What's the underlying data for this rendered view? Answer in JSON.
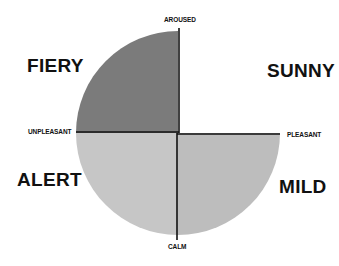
{
  "diagram": {
    "type": "mood-quadrant",
    "center": {
      "x": 178,
      "y": 133
    },
    "radius": 102,
    "axes": {
      "top": "AROUSED",
      "bottom": "CALM",
      "left": "UNPLEASANT",
      "right": "PLEASANT"
    },
    "quadrants": [
      {
        "id": "top-left",
        "label": "FIERY",
        "fill": "#7b7b7b"
      },
      {
        "id": "top-right",
        "label": "SUNNY",
        "fill": "#ffffff"
      },
      {
        "id": "bottom-left",
        "label": "ALERT",
        "fill": "#c6c6c6"
      },
      {
        "id": "bottom-right",
        "label": "MILD",
        "fill": "#bdbdbd"
      }
    ],
    "line_color": "#111111"
  }
}
